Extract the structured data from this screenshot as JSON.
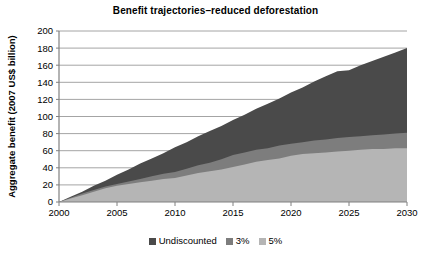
{
  "chart_data": {
    "type": "area",
    "title": "Benefit trajectories–reduced deforestation",
    "xlabel": "",
    "ylabel": "Aggregate benefit (2007 US$ billion)",
    "xlim": [
      2000,
      2030
    ],
    "ylim": [
      0,
      200
    ],
    "x_ticks": [
      2000,
      2005,
      2010,
      2015,
      2020,
      2025,
      2030
    ],
    "x_tick_labels": [
      "2000",
      "2005",
      "2010",
      "2015",
      "2020",
      "2025",
      "2030"
    ],
    "y_ticks": [
      0,
      20,
      40,
      60,
      80,
      100,
      120,
      140,
      160,
      180,
      200
    ],
    "y_tick_labels": [
      "0",
      "20",
      "40",
      "60",
      "80",
      "100",
      "120",
      "140",
      "160",
      "180",
      "200"
    ],
    "grid": "horizontal",
    "legend_position": "bottom-center",
    "stacking": "overlaid",
    "x": [
      2000,
      2001,
      2002,
      2003,
      2004,
      2005,
      2006,
      2007,
      2008,
      2009,
      2010,
      2011,
      2012,
      2013,
      2014,
      2015,
      2016,
      2017,
      2018,
      2019,
      2020,
      2021,
      2022,
      2023,
      2024,
      2025,
      2026,
      2027,
      2028,
      2029,
      2030
    ],
    "series": [
      {
        "name": "Undiscounted",
        "color": "#4a4a4a",
        "values": [
          0,
          6,
          12,
          19,
          25,
          32,
          38,
          45,
          51,
          57,
          64,
          70,
          77,
          83,
          89,
          96,
          102,
          109,
          115,
          121,
          128,
          134,
          141,
          147,
          153,
          154,
          160,
          165,
          170,
          175,
          180
        ]
      },
      {
        "name": "3%",
        "color": "#7d7d7d",
        "values": [
          0,
          5,
          10,
          14,
          18,
          21,
          24,
          27,
          30,
          33,
          35,
          39,
          43,
          46,
          50,
          55,
          58,
          61,
          63,
          66,
          68,
          70,
          72,
          73,
          75,
          76,
          77,
          78,
          79,
          80,
          81
        ]
      },
      {
        "name": "5%",
        "color": "#b5b5b5",
        "values": [
          0,
          4,
          8,
          12,
          16,
          19,
          21,
          23,
          25,
          27,
          28,
          31,
          34,
          36,
          38,
          41,
          44,
          47,
          49,
          51,
          54,
          56,
          57,
          58,
          59,
          60,
          61,
          62,
          62,
          63,
          63
        ]
      }
    ]
  },
  "legend": {
    "items": [
      {
        "label": "Undiscounted",
        "color": "#4a4a4a"
      },
      {
        "label": "3%",
        "color": "#7d7d7d"
      },
      {
        "label": "5%",
        "color": "#b5b5b5"
      }
    ]
  },
  "axes": {
    "plot_left": 59,
    "plot_right": 407,
    "plot_top": 31,
    "plot_bottom": 202,
    "axis_color": "#808080",
    "grid_color": "#9a9a9a"
  }
}
